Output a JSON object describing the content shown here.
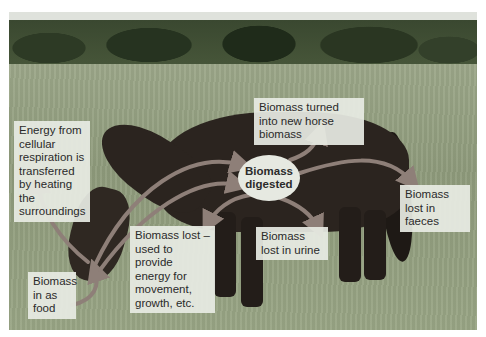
{
  "figure": {
    "colors": {
      "arrow": "#8e7f78",
      "arrow_outline": "#5a4f4a",
      "label_bg": "#e8ebe4",
      "ellipse_bg": "#e6e9e1",
      "text": "#2a2a2a"
    },
    "center_node": {
      "label": "Biomass digested"
    },
    "labels": {
      "energy_respiration": "Energy from cellular respiration is transferred by heating the surroundings",
      "horse_biomass": "Biomass turned into new horse biomass",
      "faeces": "Biomass lost in faeces",
      "urine": "Biomass lost in urine",
      "movement": "Biomass lost – used to provide energy for movement, growth, etc.",
      "food": "Biomass in as food"
    }
  }
}
